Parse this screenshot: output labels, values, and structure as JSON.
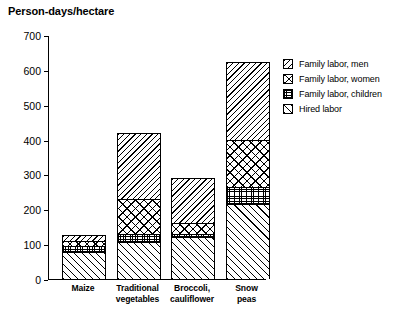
{
  "chart_data": {
    "type": "bar",
    "subtype": "stacked-bar",
    "title": "Person-days/hectare",
    "xlabel": "",
    "ylabel": "Person-days/hectare",
    "ylim": [
      0,
      700
    ],
    "yticks": [
      0,
      100,
      200,
      300,
      400,
      500,
      600,
      700
    ],
    "ytick_labels": [
      "0",
      "100",
      "200",
      "300",
      "400",
      "500",
      "600",
      "700"
    ],
    "grid": false,
    "legend_position": "right",
    "categories": [
      "Maize",
      "Traditional vegetables",
      "Broccoli, cauliflower",
      "Snow peas"
    ],
    "category_lines": [
      [
        "Maize"
      ],
      [
        "Traditional",
        "vegetables"
      ],
      [
        "Broccoli,",
        "cauliflower"
      ],
      [
        "Snow",
        "peas"
      ]
    ],
    "series": [
      {
        "name": "Hired labor",
        "pattern": "forward-diagonal-hatch",
        "values": [
          78,
          105,
          120,
          215
        ]
      },
      {
        "name": "Family labor, children",
        "pattern": "fine-grid-stipple",
        "values": [
          17,
          25,
          10,
          48
        ]
      },
      {
        "name": "Family labor, women",
        "pattern": "cross-hatch",
        "values": [
          15,
          100,
          30,
          137
        ]
      },
      {
        "name": "Family labor, men",
        "pattern": "backward-diagonal-hatch",
        "values": [
          15,
          188,
          130,
          222
        ]
      }
    ],
    "stack_order_bottom_to_top": [
      "Hired labor",
      "Family labor, children",
      "Family labor, women",
      "Family labor, men"
    ],
    "totals": [
      125,
      418,
      290,
      622
    ]
  },
  "legend": {
    "entries": [
      {
        "label": "Family labor, men",
        "pattern": "backward-diagonal-hatch"
      },
      {
        "label": "Family labor, women",
        "pattern": "cross-hatch"
      },
      {
        "label": "Family labor, children",
        "pattern": "fine-grid-stipple"
      },
      {
        "label": "Hired labor",
        "pattern": "forward-diagonal-hatch"
      }
    ]
  },
  "colors": {
    "ink": "#000000",
    "background": "#ffffff"
  }
}
